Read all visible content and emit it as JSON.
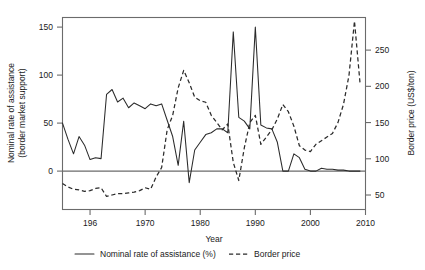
{
  "chart_data": {
    "type": "line",
    "title": "",
    "xlabel": "Year",
    "ylabel": "Nominal rate of assistance (border market support)",
    "ylabel_line1": "Nominal rate of assistance",
    "ylabel_line2": "(border market support)",
    "y2label": "Border price (US$/ton)",
    "xlim": [
      1955,
      2010
    ],
    "ylim": [
      -40,
      160
    ],
    "y2lim": [
      30,
      295
    ],
    "grid": false,
    "legend_position": "below-axis",
    "xticks": [
      1960,
      1970,
      1980,
      1990,
      2000,
      2010
    ],
    "xticklabels": [
      "196",
      "1970",
      "1980",
      "1990",
      "2000",
      "2010"
    ],
    "yticks": [
      0,
      50,
      100,
      150
    ],
    "yticklabels": [
      "0",
      "50",
      "100",
      "150"
    ],
    "y2ticks": [
      50,
      100,
      150,
      200,
      250
    ],
    "y2ticklabels": [
      "50",
      "100",
      "150",
      "200",
      "250"
    ],
    "series": [
      {
        "name": "Nominal rate of assistance (%)",
        "style": "solid",
        "axis": "left",
        "units": "%",
        "x": [
          1955,
          1956,
          1957,
          1958,
          1959,
          1960,
          1961,
          1962,
          1963,
          1964,
          1965,
          1966,
          1967,
          1968,
          1969,
          1970,
          1971,
          1972,
          1973,
          1974,
          1975,
          1976,
          1977,
          1978,
          1979,
          1980,
          1981,
          1982,
          1983,
          1984,
          1985,
          1986,
          1987,
          1988,
          1989,
          1990,
          1991,
          1992,
          1993,
          1994,
          1995,
          1996,
          1997,
          1998,
          1999,
          2000,
          2001,
          2002,
          2003,
          2004,
          2005,
          2006,
          2007,
          2008,
          2009
        ],
        "values": [
          50,
          33,
          18,
          36,
          27,
          12,
          14,
          13,
          80,
          85,
          72,
          76,
          66,
          71,
          68,
          65,
          70,
          68,
          70,
          53,
          36,
          6,
          52,
          -12,
          22,
          30,
          38,
          40,
          44,
          44,
          40,
          145,
          56,
          52,
          44,
          150,
          48,
          45,
          44,
          30,
          0,
          0,
          18,
          14,
          2,
          0,
          0,
          3,
          2,
          2,
          1,
          1,
          0,
          0,
          0
        ]
      },
      {
        "name": "Border price",
        "style": "dashed",
        "axis": "right",
        "units": "US$/ton",
        "x": [
          1955,
          1956,
          1957,
          1958,
          1959,
          1960,
          1961,
          1962,
          1963,
          1964,
          1965,
          1966,
          1967,
          1968,
          1969,
          1970,
          1971,
          1972,
          1973,
          1974,
          1975,
          1976,
          1977,
          1978,
          1979,
          1980,
          1981,
          1982,
          1983,
          1984,
          1985,
          1986,
          1987,
          1988,
          1989,
          1990,
          1991,
          1992,
          1993,
          1994,
          1995,
          1996,
          1997,
          1998,
          1999,
          2000,
          2001,
          2002,
          2003,
          2004,
          2005,
          2006,
          2007,
          2008,
          2009
        ],
        "values": [
          66,
          61,
          58,
          57,
          55,
          56,
          59,
          60,
          48,
          50,
          52,
          52,
          53,
          54,
          56,
          60,
          58,
          75,
          88,
          140,
          160,
          198,
          222,
          205,
          185,
          180,
          178,
          160,
          150,
          140,
          148,
          95,
          70,
          115,
          150,
          160,
          120,
          130,
          140,
          155,
          175,
          165,
          145,
          118,
          112,
          110,
          120,
          125,
          130,
          135,
          150,
          175,
          215,
          290,
          205
        ]
      }
    ],
    "legend": [
      {
        "label": "Nominal rate of assistance (%)",
        "style": "solid"
      },
      {
        "label": "Border price",
        "style": "dashed"
      }
    ]
  }
}
